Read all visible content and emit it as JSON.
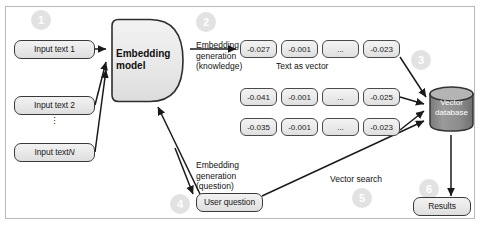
{
  "diagram": {
    "colors": {
      "node_border": "#3a3a3a",
      "node_fill": "#eaeaea",
      "badge_fill": "#e2e2e2",
      "badge_text": "#ffffff",
      "frame_border": "#b9b9b9",
      "db_fill": "#8f8f8f",
      "arrow": "#1a1a1a"
    },
    "inputs": [
      {
        "label": "Input text 1"
      },
      {
        "label": "Input text 2"
      },
      {
        "label": "Input text N",
        "italic_suffix": "N"
      }
    ],
    "vertical_ellipsis": "⋮",
    "embedding_model": {
      "label": "Embedding model"
    },
    "vector_rows": [
      {
        "cells": [
          "-0.027",
          "-0.001",
          "...",
          "-0.023"
        ]
      },
      {
        "cells": [
          "-0.041",
          "-0.001",
          "...",
          "-0.025"
        ]
      },
      {
        "cells": [
          "-0.035",
          "-0.001",
          "...",
          "-0.023"
        ]
      }
    ],
    "vector_caption": "Text as vector",
    "vector_database": {
      "label": "Vector database"
    },
    "user_question": {
      "label": "User question"
    },
    "results": {
      "label": "Results"
    },
    "edge_labels": {
      "embedding_knowledge": "Embedding generation (knowledge)",
      "embedding_knowledge_lines": [
        "Embedding",
        "generation",
        "(knowledge)"
      ],
      "embedding_question_lines": [
        "Embedding",
        "generation",
        "(question)"
      ],
      "vector_search": "Vector search"
    },
    "badges": [
      {
        "number": "1"
      },
      {
        "number": "2"
      },
      {
        "number": "3"
      },
      {
        "number": "4"
      },
      {
        "number": "5"
      },
      {
        "number": "6"
      }
    ]
  }
}
